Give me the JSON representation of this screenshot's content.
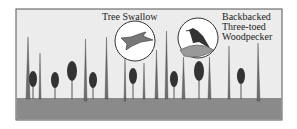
{
  "labels": {
    "tree_swallow": "Tree Swallow",
    "woodpecker_line1": "Backbacked",
    "woodpecker_line2": "Three-toed",
    "woodpecker_line3": "Woodpecker"
  },
  "colors": {
    "sky": "#ececec",
    "ground": "#8a8a8a",
    "snag": "#6e6e6e",
    "conifer": "#3a3a3a",
    "frame": "#555555"
  }
}
